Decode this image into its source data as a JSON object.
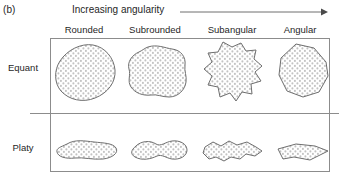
{
  "figure": {
    "panel_label": "(b)",
    "axis_caption": "Increasing angularity",
    "arrow_icon": "right-arrow-icon",
    "columns": [
      {
        "key": "rounded",
        "label": "Rounded",
        "center_x": 84
      },
      {
        "key": "subrounded",
        "label": "Subrounded",
        "center_x": 155
      },
      {
        "key": "subangular",
        "label": "Subangular",
        "center_x": 232
      },
      {
        "key": "angular",
        "label": "Angular",
        "center_x": 300
      }
    ],
    "rows": [
      {
        "key": "equant",
        "label": "Equant"
      },
      {
        "key": "platy",
        "label": "Platy"
      }
    ],
    "cells": [
      {
        "row": "equant",
        "column": "rounded",
        "shape_name": "grain-equant-rounded"
      },
      {
        "row": "equant",
        "column": "subrounded",
        "shape_name": "grain-equant-subrounded"
      },
      {
        "row": "equant",
        "column": "subangular",
        "shape_name": "grain-equant-subangular"
      },
      {
        "row": "equant",
        "column": "angular",
        "shape_name": "grain-equant-angular"
      },
      {
        "row": "platy",
        "column": "rounded",
        "shape_name": "grain-platy-rounded"
      },
      {
        "row": "platy",
        "column": "subrounded",
        "shape_name": "grain-platy-subrounded"
      },
      {
        "row": "platy",
        "column": "subangular",
        "shape_name": "grain-platy-subangular"
      },
      {
        "row": "platy",
        "column": "angular",
        "shape_name": "grain-platy-angular"
      }
    ],
    "colors": {
      "text": "#1f1f1f",
      "rule": "#8c8c8c",
      "grain_outline": "#6e6e6e",
      "grain_fill": "#ffffff",
      "stipple": "#b9b9b9",
      "background": "#ffffff"
    }
  }
}
